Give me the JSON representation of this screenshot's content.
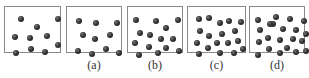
{
  "panels": [
    {
      "id": "reference",
      "label": "",
      "x": 4,
      "w": 57,
      "dots": [
        [
          16,
          12
        ],
        [
          32,
          20
        ],
        [
          53,
          12
        ],
        [
          10,
          30
        ],
        [
          25,
          31
        ],
        [
          42,
          29
        ],
        [
          53,
          38
        ],
        [
          11,
          46
        ],
        [
          26,
          42
        ],
        [
          40,
          45
        ]
      ]
    },
    {
      "id": "a",
      "label": "(a)",
      "x": 66,
      "w": 56,
      "dots": [
        [
          12,
          14
        ],
        [
          29,
          16
        ],
        [
          50,
          16
        ],
        [
          16,
          28
        ],
        [
          28,
          32
        ],
        [
          43,
          28
        ],
        [
          11,
          44
        ],
        [
          25,
          47
        ],
        [
          39,
          42
        ],
        [
          52,
          46
        ]
      ]
    },
    {
      "id": "b",
      "label": "(b)",
      "x": 127,
      "w": 56,
      "dots": [
        [
          8,
          13
        ],
        [
          28,
          14
        ],
        [
          50,
          13
        ],
        [
          38,
          21
        ],
        [
          12,
          26
        ],
        [
          22,
          28
        ],
        [
          33,
          32
        ],
        [
          45,
          32
        ],
        [
          7,
          36
        ],
        [
          21,
          40
        ],
        [
          38,
          41
        ],
        [
          11,
          48
        ],
        [
          30,
          46
        ],
        [
          51,
          44
        ]
      ]
    },
    {
      "id": "c",
      "label": "(c)",
      "x": 187,
      "w": 59,
      "dots": [
        [
          11,
          12
        ],
        [
          21,
          11
        ],
        [
          32,
          16
        ],
        [
          41,
          14
        ],
        [
          53,
          15
        ],
        [
          12,
          24
        ],
        [
          21,
          29
        ],
        [
          34,
          27
        ],
        [
          47,
          24
        ],
        [
          9,
          36
        ],
        [
          20,
          41
        ],
        [
          29,
          36
        ],
        [
          40,
          36
        ],
        [
          50,
          34
        ],
        [
          11,
          47
        ],
        [
          32,
          46
        ],
        [
          46,
          46
        ],
        [
          55,
          42
        ]
      ]
    },
    {
      "id": "d",
      "label": "(d)",
      "x": 249,
      "w": 56,
      "dots": [
        [
          8,
          13
        ],
        [
          26,
          10
        ],
        [
          40,
          12
        ],
        [
          54,
          14
        ],
        [
          10,
          23
        ],
        [
          23,
          17
        ],
        [
          33,
          22
        ],
        [
          46,
          23
        ],
        [
          56,
          27
        ],
        [
          9,
          35
        ],
        [
          18,
          31
        ],
        [
          30,
          33
        ],
        [
          43,
          32
        ],
        [
          52,
          34
        ],
        [
          8,
          48
        ],
        [
          19,
          42
        ],
        [
          30,
          46
        ],
        [
          37,
          41
        ],
        [
          46,
          45
        ],
        [
          56,
          44
        ],
        [
          20,
          17
        ]
      ]
    }
  ],
  "counts": {
    "reference": 10,
    "a": 10,
    "b": 14,
    "c": 18,
    "d": 21
  }
}
